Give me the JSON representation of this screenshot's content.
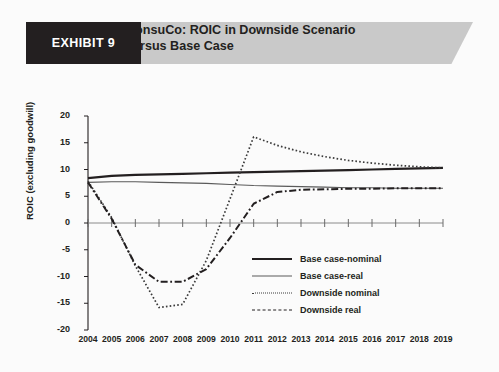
{
  "banner": {
    "exhibit_label": "EXHIBIT 9",
    "title_line1": "ConsuCo: ROIC in Downside Scenario",
    "title_line2": "versus Base Case"
  },
  "chart_data": {
    "type": "line",
    "title": "ConsuCo: ROIC in Downside Scenario versus Base Case",
    "xlabel": "",
    "ylabel": "ROIC (excluding goodwill)",
    "ylim": [
      -20,
      20
    ],
    "yticks": [
      20,
      15,
      10,
      5,
      0,
      -5,
      -10,
      -15,
      -20
    ],
    "grid": false,
    "legend_position": "center-right",
    "categories": [
      "2004",
      "2005",
      "2006",
      "2007",
      "2008",
      "2009",
      "2010",
      "2011",
      "2012",
      "2013",
      "2014",
      "2015",
      "2016",
      "2017",
      "2018",
      "2019"
    ],
    "series": [
      {
        "name": "Base case-nominal",
        "style": "solid-thick",
        "color": "#231f20",
        "values": [
          8.4,
          8.8,
          9.0,
          9.1,
          9.2,
          9.3,
          9.4,
          9.5,
          9.6,
          9.7,
          9.8,
          9.9,
          10.0,
          10.1,
          10.2,
          10.3
        ]
      },
      {
        "name": "Base case-real",
        "style": "solid-thin",
        "color": "#5a5a5a",
        "values": [
          7.6,
          7.7,
          7.7,
          7.6,
          7.5,
          7.4,
          7.2,
          7.0,
          6.9,
          6.8,
          6.7,
          6.6,
          6.6,
          6.5,
          6.5,
          6.5
        ]
      },
      {
        "name": "Downside nominal",
        "style": "dotted",
        "color": "#3a3a3a",
        "values": [
          7.8,
          1.0,
          -8.0,
          -15.8,
          -15.2,
          -7.0,
          4.5,
          16.1,
          14.5,
          13.3,
          12.4,
          11.7,
          11.2,
          10.8,
          10.5,
          10.3
        ]
      },
      {
        "name": "Downside real",
        "style": "dash-dot",
        "color": "#231f20",
        "values": [
          7.6,
          0.8,
          -7.8,
          -11.0,
          -11.0,
          -8.6,
          -2.8,
          3.6,
          5.8,
          6.2,
          6.3,
          6.4,
          6.4,
          6.5,
          6.5,
          6.5
        ]
      }
    ]
  },
  "legend": {
    "items": [
      {
        "label": "Base case-nominal"
      },
      {
        "label": "Base case-real"
      },
      {
        "label": "Downside nominal"
      },
      {
        "label": "Downside real"
      }
    ]
  }
}
